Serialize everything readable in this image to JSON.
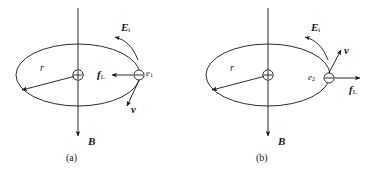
{
  "figure": {
    "stroke_color": "#151515",
    "background_color": "#ffffff",
    "panels": [
      {
        "id": "a",
        "caption": "(a)",
        "center_symbol": "⊕",
        "particle_symbol": "⊖",
        "labels": {
          "radius": "r",
          "induced_field": "E",
          "induced_field_sub": "i",
          "magnetic_field": "B",
          "velocity": "v",
          "lorentz_force": "f",
          "lorentz_force_sub": "L",
          "electron": "e",
          "electron_sub": "1"
        },
        "directions": {
          "velocity": "down-left",
          "lorentz_force": "left-inward",
          "induced_field": "counterclockwise-arc",
          "magnetic_field": "down",
          "radius": "down-left"
        }
      },
      {
        "id": "b",
        "caption": "(b)",
        "center_symbol": "⊕",
        "particle_symbol": "⊖",
        "labels": {
          "radius": "r",
          "induced_field": "E",
          "induced_field_sub": "i",
          "magnetic_field": "B",
          "velocity": "v",
          "lorentz_force": "f",
          "lorentz_force_sub": "L",
          "electron": "e",
          "electron_sub": "2"
        },
        "directions": {
          "velocity": "up-right",
          "lorentz_force": "right-outward",
          "induced_field": "counterclockwise-arc",
          "magnetic_field": "down",
          "radius": "down-left"
        }
      }
    ]
  }
}
